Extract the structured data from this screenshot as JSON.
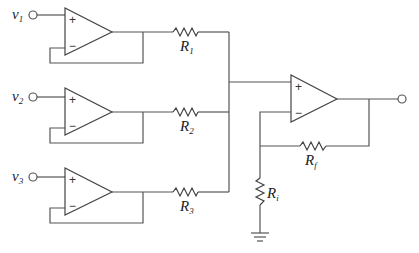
{
  "diagram": {
    "type": "circuit",
    "inputs": [
      {
        "label": "v",
        "subscript": "1"
      },
      {
        "label": "v",
        "subscript": "2"
      },
      {
        "label": "v",
        "subscript": "3"
      }
    ],
    "resistors": [
      {
        "id": "R1",
        "label": "R",
        "subscript": "1"
      },
      {
        "id": "R2",
        "label": "R",
        "subscript": "2"
      },
      {
        "id": "R3",
        "label": "R",
        "subscript": "3"
      },
      {
        "id": "Rf",
        "label": "R",
        "subscript": "f"
      },
      {
        "id": "Ri",
        "label": "R",
        "subscript": "i"
      }
    ],
    "opamp_signs": {
      "plus": "+",
      "minus": "−"
    }
  }
}
